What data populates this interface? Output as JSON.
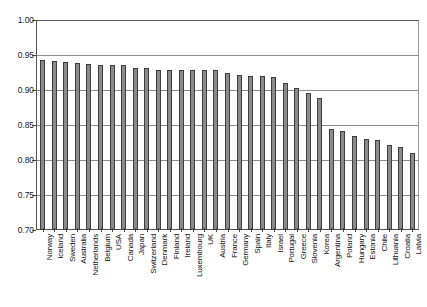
{
  "chart_data": {
    "type": "bar",
    "title": "",
    "subtitle": "",
    "xlabel": "",
    "ylabel": "",
    "ylim": [
      0.7,
      1.0
    ],
    "yticks": [
      "0.70",
      "0.75",
      "0.80",
      "0.85",
      "0.90",
      "0.95",
      "1.00"
    ],
    "ytick_values": [
      0.7,
      0.75,
      0.8,
      0.85,
      0.9,
      0.95,
      1.0
    ],
    "grid": true,
    "legend": false,
    "legend_position": "none",
    "bar_color": "#8a8a8a",
    "bar_edge_color": "#3d3d3d",
    "axis_color": "#555555",
    "gridline_color": "#8d8d8d",
    "categories": [
      "Norway",
      "Iceland",
      "Sweden",
      "Australia",
      "Netherlands",
      "Belgium",
      "USA",
      "Canada",
      "Japan",
      "Switzerland",
      "Denmark",
      "Finland",
      "Ireland",
      "Luxembourg",
      "UK",
      "Austria",
      "France",
      "Germany",
      "Spain",
      "Italy",
      "Israel",
      "Portugal",
      "Greece",
      "Slovenia",
      "Korea",
      "Argentina",
      "Poland",
      "Hungary",
      "Estonia",
      "Chile",
      "Lithuania",
      "Croatia",
      "Latvia"
    ],
    "values": [
      0.943,
      0.941,
      0.94,
      0.938,
      0.937,
      0.936,
      0.936,
      0.936,
      0.931,
      0.931,
      0.929,
      0.929,
      0.929,
      0.929,
      0.929,
      0.928,
      0.925,
      0.921,
      0.92,
      0.92,
      0.918,
      0.91,
      0.903,
      0.896,
      0.888,
      0.845,
      0.841,
      0.834,
      0.83,
      0.829,
      0.822,
      0.818,
      0.81
    ]
  }
}
